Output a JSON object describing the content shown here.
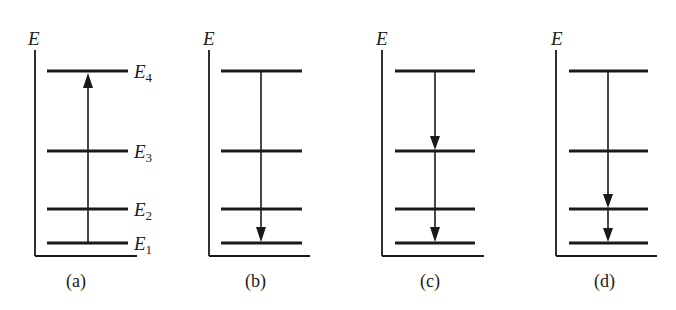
{
  "figure": {
    "axis_label": "E",
    "level_labels": [
      {
        "base": "E",
        "sub": "4"
      },
      {
        "base": "E",
        "sub": "3"
      },
      {
        "base": "E",
        "sub": "2"
      },
      {
        "base": "E",
        "sub": "1"
      }
    ],
    "colors": {
      "ink": "#1a1a1a",
      "background": "#ffffff"
    },
    "panels": [
      {
        "caption": "(a)",
        "transitions": [
          {
            "from": "E1",
            "to": "E4",
            "direction": "up"
          }
        ],
        "show_level_labels": true
      },
      {
        "caption": "(b)",
        "transitions": [
          {
            "from": "E4",
            "to": "E1",
            "direction": "down"
          }
        ],
        "show_level_labels": false
      },
      {
        "caption": "(c)",
        "transitions": [
          {
            "from": "E4",
            "to": "E3",
            "direction": "down"
          },
          {
            "from": "E3",
            "to": "E1",
            "direction": "down"
          }
        ],
        "show_level_labels": false
      },
      {
        "caption": "(d)",
        "transitions": [
          {
            "from": "E4",
            "to": "E2",
            "direction": "down"
          },
          {
            "from": "E2",
            "to": "E1",
            "direction": "down"
          }
        ],
        "show_level_labels": false
      }
    ]
  }
}
